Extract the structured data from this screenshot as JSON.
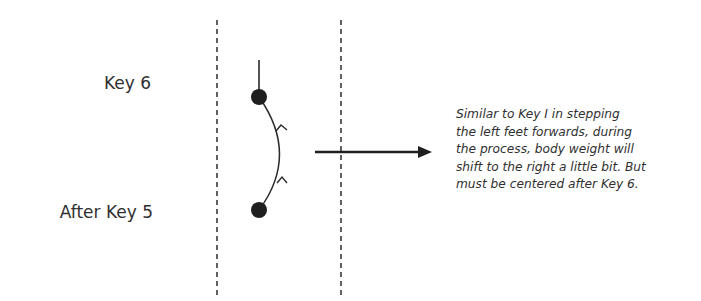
{
  "diagram": {
    "labels": {
      "top": "Key 6",
      "bottom": "After Key 5"
    },
    "description_lines": [
      "Similar to Key I in stepping",
      "the left feet forwards, during",
      "the process, body weight will",
      "shift to the right a little bit. But",
      "must be centered after Key 6."
    ],
    "elements": {
      "boundary_lines": 2,
      "footstep_dots": 2,
      "path_direction": "upward",
      "pointer_arrow": "right"
    },
    "colors": {
      "ink": "#1f1f1f",
      "text": "#2f2f2f",
      "background": "#ffffff"
    }
  }
}
